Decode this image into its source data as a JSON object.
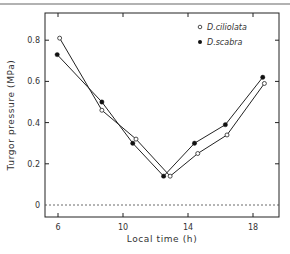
{
  "chart_data": {
    "type": "line",
    "title": "",
    "xlabel": "Local time (h)",
    "ylabel": "Turgor pressure (MPa)",
    "xlim": [
      5.2,
      19.8
    ],
    "ylim": [
      -0.06,
      0.94
    ],
    "xticks": [
      6,
      10,
      14,
      18
    ],
    "xtick_labels": [
      "6",
      "10",
      "14",
      "18"
    ],
    "yticks": [
      0,
      0.2,
      0.4,
      0.6,
      0.8
    ],
    "ytick_labels": [
      "0",
      "0.2",
      "0.4",
      "0.6",
      "0.8"
    ],
    "grid": false,
    "reference_line": {
      "y": 0,
      "style": "dashed"
    },
    "legend_position": "upper right",
    "series": [
      {
        "name": "D. ciliolata",
        "legend_label": "D.ciliolata",
        "marker": "open-circle",
        "x": [
          6.1,
          8.7,
          10.8,
          12.9,
          14.6,
          16.4,
          18.7
        ],
        "values": [
          0.81,
          0.46,
          0.32,
          0.14,
          0.25,
          0.34,
          0.59
        ]
      },
      {
        "name": "D. scabra",
        "legend_label": "D.scabra",
        "marker": "filled-circle",
        "x": [
          5.95,
          8.7,
          10.6,
          12.5,
          14.4,
          16.3,
          18.6
        ],
        "values": [
          0.73,
          0.5,
          0.3,
          0.14,
          0.3,
          0.39,
          0.62
        ]
      }
    ]
  }
}
